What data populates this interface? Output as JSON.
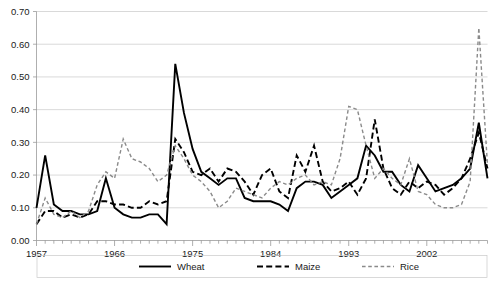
{
  "chart_data": {
    "type": "line",
    "title": "",
    "subtitle": "",
    "xlabel": "",
    "ylabel": "",
    "grid": true,
    "legend_position": "bottom",
    "xlim": [
      1957,
      2009
    ],
    "ylim": [
      0.0,
      0.7
    ],
    "ytick_labels": [
      "0.00",
      "0.10",
      "0.20",
      "0.30",
      "0.40",
      "0.50",
      "0.60",
      "0.70"
    ],
    "ytick_values": [
      0.0,
      0.1,
      0.2,
      0.3,
      0.4,
      0.5,
      0.6,
      0.7
    ],
    "xtick_labels": [
      "1957",
      "1966",
      "1975",
      "1984",
      "1993",
      "2002"
    ],
    "xtick_values": [
      1957,
      1966,
      1975,
      1984,
      1993,
      2002
    ],
    "x": [
      1957,
      1958,
      1959,
      1960,
      1961,
      1962,
      1963,
      1964,
      1965,
      1966,
      1967,
      1968,
      1969,
      1970,
      1971,
      1972,
      1973,
      1974,
      1975,
      1976,
      1977,
      1978,
      1979,
      1980,
      1981,
      1982,
      1983,
      1984,
      1985,
      1986,
      1987,
      1988,
      1989,
      1990,
      1991,
      1992,
      1993,
      1994,
      1995,
      1996,
      1997,
      1998,
      1999,
      2000,
      2001,
      2002,
      2003,
      2004,
      2005,
      2006,
      2007,
      2008,
      2009
    ],
    "series": [
      {
        "name": "Wheat",
        "style": "solid",
        "color": "#000000",
        "values": [
          0.1,
          0.26,
          0.11,
          0.09,
          0.09,
          0.08,
          0.08,
          0.09,
          0.19,
          0.1,
          0.08,
          0.07,
          0.07,
          0.08,
          0.08,
          0.05,
          0.54,
          0.39,
          0.28,
          0.21,
          0.19,
          0.17,
          0.19,
          0.19,
          0.13,
          0.12,
          0.12,
          0.12,
          0.11,
          0.09,
          0.16,
          0.18,
          0.18,
          0.17,
          0.13,
          0.15,
          0.17,
          0.19,
          0.29,
          0.26,
          0.21,
          0.21,
          0.17,
          0.15,
          0.23,
          0.19,
          0.15,
          0.16,
          0.17,
          0.19,
          0.22,
          0.36,
          0.19
        ]
      },
      {
        "name": "Maize",
        "style": "dashed",
        "color": "#000000",
        "values": [
          0.05,
          0.09,
          0.09,
          0.07,
          0.08,
          0.07,
          0.08,
          0.12,
          0.12,
          0.11,
          0.11,
          0.1,
          0.1,
          0.12,
          0.11,
          0.12,
          0.31,
          0.27,
          0.21,
          0.2,
          0.22,
          0.18,
          0.22,
          0.21,
          0.18,
          0.14,
          0.2,
          0.22,
          0.15,
          0.13,
          0.26,
          0.21,
          0.29,
          0.18,
          0.15,
          0.16,
          0.18,
          0.14,
          0.19,
          0.37,
          0.22,
          0.16,
          0.14,
          0.18,
          0.16,
          0.18,
          0.17,
          0.14,
          0.16,
          0.19,
          0.25,
          0.33,
          0.22
        ]
      },
      {
        "name": "Rice",
        "style": "dashed",
        "color": "#8a8a8a",
        "values": [
          0.05,
          0.13,
          0.08,
          0.07,
          0.09,
          0.07,
          0.09,
          0.17,
          0.21,
          0.19,
          0.31,
          0.25,
          0.24,
          0.22,
          0.18,
          0.2,
          0.29,
          0.25,
          0.2,
          0.18,
          0.15,
          0.1,
          0.12,
          0.16,
          0.15,
          0.14,
          0.13,
          0.16,
          0.18,
          0.17,
          0.19,
          0.2,
          0.17,
          0.18,
          0.17,
          0.25,
          0.41,
          0.4,
          0.29,
          0.19,
          0.22,
          0.19,
          0.17,
          0.25,
          0.15,
          0.14,
          0.11,
          0.1,
          0.1,
          0.11,
          0.18,
          0.65,
          0.23
        ]
      }
    ]
  },
  "legend": {
    "items": [
      {
        "label": "Wheat"
      },
      {
        "label": "Maize"
      },
      {
        "label": "Rice"
      }
    ]
  }
}
